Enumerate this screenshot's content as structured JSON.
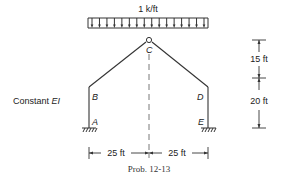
{
  "load": {
    "label": "1 k/ft",
    "type": "uniform distributed",
    "arrow_count": 16
  },
  "nodes": {
    "A": {
      "label": "A",
      "support": "fixed"
    },
    "B": {
      "label": "B"
    },
    "C": {
      "label": "C",
      "support": "hinge"
    },
    "D": {
      "label": "D"
    },
    "E": {
      "label": "E",
      "support": "fixed"
    }
  },
  "note": {
    "prefix": "Constant ",
    "ei": "EI"
  },
  "dimensions": {
    "vertical_upper": "15 ft",
    "vertical_lower": "20 ft",
    "horizontal_left": "25 ft",
    "horizontal_right": "25 ft"
  },
  "caption": "Prob. 12-13",
  "colors": {
    "line": "#333333",
    "background": "#ffffff"
  }
}
